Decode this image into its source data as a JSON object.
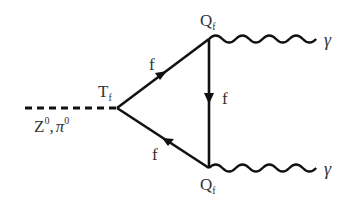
{
  "diagram": {
    "colors": {
      "line": "#111111",
      "text": "#333333",
      "background": "#ffffff"
    },
    "vertices": [
      {
        "id": "left",
        "label": "T",
        "subscript": "f"
      },
      {
        "id": "top",
        "label": "Q",
        "subscript": "f"
      },
      {
        "id": "bottom",
        "label": "Q",
        "subscript": "f"
      }
    ],
    "incoming": {
      "type": "dashed",
      "label_main": "Z",
      "label_sup1": "0",
      "label_sep": ",",
      "label_pi": "π",
      "label_sup2": "0"
    },
    "fermion_lines": [
      {
        "from": "left",
        "to": "top",
        "label": "f",
        "arrow": "toward-top"
      },
      {
        "from": "top",
        "to": "bottom",
        "label": "f",
        "arrow": "downward"
      },
      {
        "from": "bottom",
        "to": "left",
        "label": "f",
        "arrow": "toward-left"
      }
    ],
    "photons": [
      {
        "from": "top",
        "label": "γ"
      },
      {
        "from": "bottom",
        "label": "γ"
      }
    ]
  }
}
